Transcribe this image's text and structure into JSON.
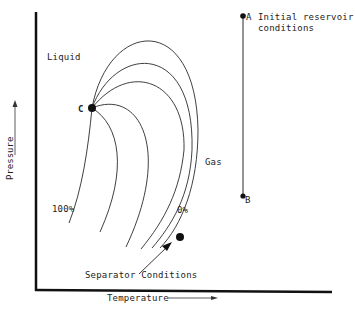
{
  "diagram": {
    "axes": {
      "x_label": "Temperature",
      "y_label": "Pressure"
    },
    "regions": {
      "liquid": "Liquid",
      "gas": "Gas"
    },
    "points": {
      "critical": {
        "label": "C"
      },
      "a": {
        "label": "A",
        "annotation_line1": "Initial reservoir",
        "annotation_line2": "conditions"
      },
      "b": {
        "label": "B"
      },
      "separator": {
        "annotation": "Separator Conditions"
      }
    },
    "quality_labels": {
      "liquid_100": "100%",
      "gas_0": "0%"
    },
    "colors": {
      "line": "#2a2a2a",
      "axis": "#111111",
      "background": "#ffffff"
    }
  }
}
